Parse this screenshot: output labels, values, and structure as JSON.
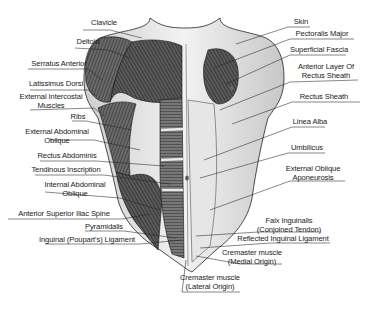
{
  "diagram": {
    "left_labels": [
      {
        "id": "clavicle",
        "lines": [
          "Clavicle"
        ]
      },
      {
        "id": "deltoid",
        "lines": [
          "Deltoid"
        ]
      },
      {
        "id": "serratus-anterior",
        "lines": [
          "Serratus Anterior"
        ]
      },
      {
        "id": "latissimus-dorsi",
        "lines": [
          "Latissimus Dorsi"
        ]
      },
      {
        "id": "external-intercostal-muscles",
        "lines": [
          "External Intercostal",
          "Muscles"
        ]
      },
      {
        "id": "ribs",
        "lines": [
          "Ribs"
        ]
      },
      {
        "id": "external-abdominal-oblique",
        "lines": [
          "External Abdominal",
          "Oblique"
        ]
      },
      {
        "id": "rectus-abdominis",
        "lines": [
          "Rectus Abdominis"
        ]
      },
      {
        "id": "tendinous-inscription",
        "lines": [
          "Tendinous Inscription"
        ]
      },
      {
        "id": "internal-abdominal-oblique",
        "lines": [
          "Internal Abdominal",
          "Oblique"
        ]
      },
      {
        "id": "anterior-superior-iliac-spine",
        "lines": [
          "Anterior Superior Iliac Spine"
        ]
      },
      {
        "id": "pyramidalis",
        "lines": [
          "Pyramidalis"
        ]
      },
      {
        "id": "inguinal-ligament",
        "lines": [
          "Inguinal (Poupart's) Ligament"
        ]
      }
    ],
    "right_labels": [
      {
        "id": "skin",
        "lines": [
          "Skin"
        ]
      },
      {
        "id": "pectoralis-major",
        "lines": [
          "Pectoralis Major"
        ]
      },
      {
        "id": "superficial-fascia",
        "lines": [
          "Superficial Fascia"
        ]
      },
      {
        "id": "anterior-layer-rectus-sheath",
        "lines": [
          "Anterior Layer Of",
          "Rectus Sheath"
        ]
      },
      {
        "id": "rectus-sheath",
        "lines": [
          "Rectus Sheath"
        ]
      },
      {
        "id": "linea-alba",
        "lines": [
          "Linea Alba"
        ]
      },
      {
        "id": "umbilicus",
        "lines": [
          "Umbilicus"
        ]
      },
      {
        "id": "external-oblique-aponeurosis",
        "lines": [
          "External Oblique",
          "Aponeurosis"
        ]
      },
      {
        "id": "falx-inguinalis",
        "lines": [
          "Falx Inguinalis",
          "(Conjoined Tendon)"
        ]
      },
      {
        "id": "reflected-inguinal-ligament",
        "lines": [
          "Reflected Inguinal Ligament"
        ]
      },
      {
        "id": "cremaster-medial",
        "lines": [
          "Cremaster muscle",
          "(Medial Origin)"
        ]
      },
      {
        "id": "cremaster-lateral",
        "lines": [
          "Cremaster muscle",
          "(Lateral Origin)"
        ]
      }
    ]
  }
}
